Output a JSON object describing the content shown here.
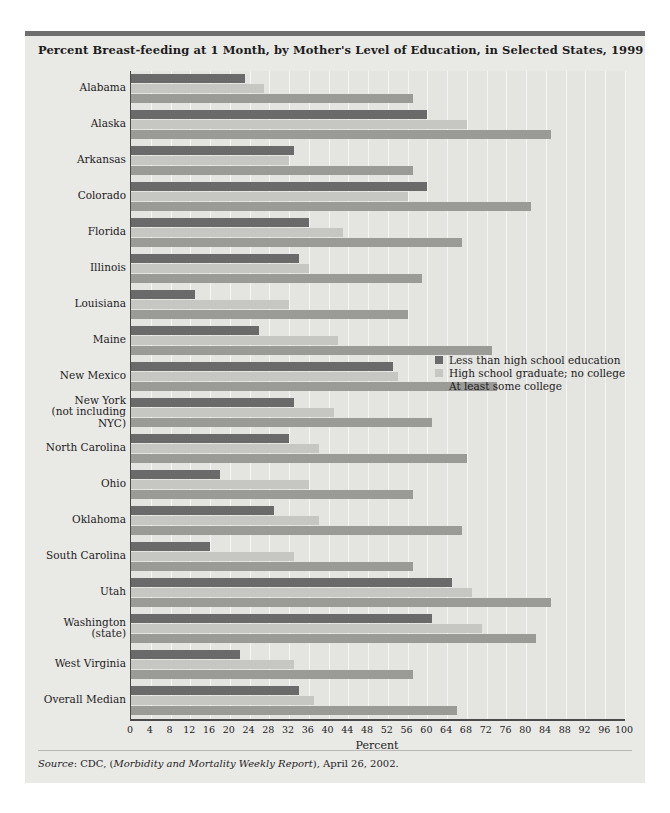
{
  "figure": {
    "title": "Percent Breast-feeding at 1 Month, by Mother's Level of Education, in Selected States, 1999",
    "source_prefix": "Source",
    "source_sep": ": CDC, (",
    "source_italic": "Morbidity and Mortality Weekly Report",
    "source_suffix": "), April 26, 2002."
  },
  "colors": {
    "series0": "#6a6a6a",
    "series1": "#c6c6c2",
    "series2": "#9a9a96",
    "panel": "#e9e9e6",
    "plot": "#e4e4e1",
    "rule": "#6e6e6e",
    "gridline": "#f5f5f3",
    "axis": "#4a4a4a",
    "text": "#1c1c1c"
  },
  "chart_data": {
    "type": "bar",
    "orientation": "horizontal",
    "title": "Percent Breast-feeding at 1 Month, by Mother's Level of Education, in Selected States, 1999",
    "xlabel": "Percent",
    "ylabel": "",
    "xlim": [
      0,
      100
    ],
    "xticks": [
      0,
      4,
      8,
      12,
      16,
      20,
      24,
      28,
      32,
      36,
      40,
      44,
      48,
      52,
      56,
      60,
      64,
      68,
      72,
      76,
      80,
      84,
      88,
      92,
      96,
      100
    ],
    "grid": "vertical",
    "legend_position": "inside-right-middle",
    "categories": [
      "Alabama",
      "Alaska",
      "Arkansas",
      "Colorado",
      "Florida",
      "Illinois",
      "Louisiana",
      "Maine",
      "New Mexico",
      "New York\n(not including\nNYC)",
      "North Carolina",
      "Ohio",
      "Oklahoma",
      "South Carolina",
      "Utah",
      "Washington\n(state)",
      "West Virginia",
      "Overall Median"
    ],
    "series": [
      {
        "name": "Less than high school education",
        "color": "#6a6a6a",
        "values": [
          23,
          60,
          33,
          60,
          36,
          34,
          13,
          26,
          53,
          33,
          32,
          18,
          29,
          16,
          65,
          61,
          22,
          34
        ]
      },
      {
        "name": "High school graduate; no college",
        "color": "#c6c6c2",
        "values": [
          27,
          68,
          32,
          56,
          43,
          36,
          32,
          42,
          54,
          41,
          38,
          36,
          38,
          33,
          69,
          71,
          33,
          37
        ]
      },
      {
        "name": "At least some college",
        "color": "#9a9a96",
        "values": [
          57,
          85,
          57,
          81,
          67,
          59,
          56,
          73,
          74,
          61,
          68,
          57,
          67,
          57,
          85,
          82,
          57,
          66
        ]
      }
    ]
  },
  "legend": {
    "items": [
      {
        "label": "Less than high school education",
        "swatch": "series0"
      },
      {
        "label": "High school graduate; no college",
        "swatch": "series1"
      },
      {
        "label": "At least some college",
        "swatch": "series2"
      }
    ]
  }
}
